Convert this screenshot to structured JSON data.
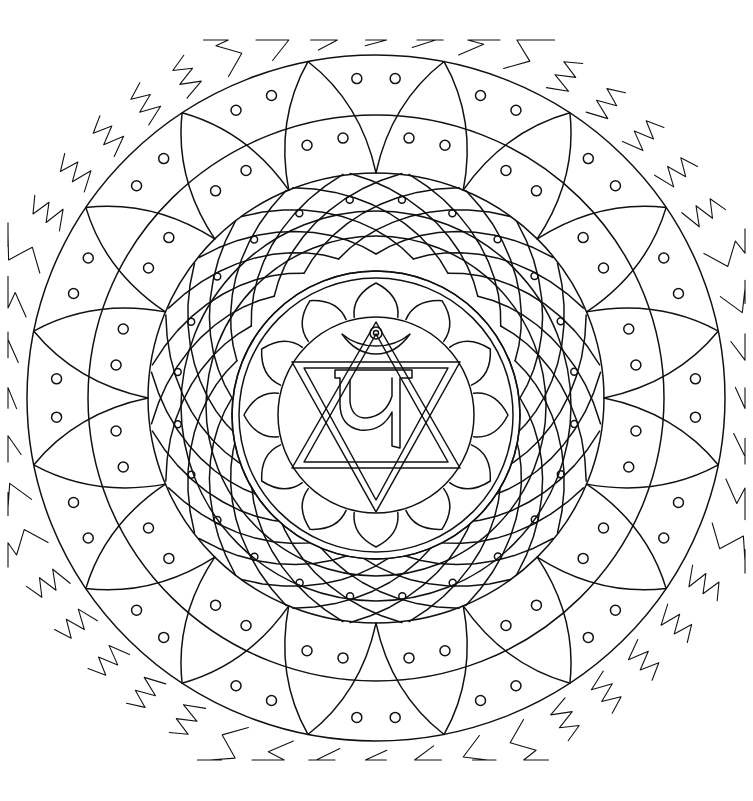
{
  "artwork": {
    "kind": "mandala coloring page",
    "style": "black line art on white",
    "center_symbol_glyph": "यं",
    "center_symbol_name": "yam (heart chakra bija)",
    "colors": {
      "ink": "#111111",
      "background": "#ffffff"
    },
    "layers": [
      {
        "name": "wavy-flame-border",
        "count": 48
      },
      {
        "name": "outer-petal-ring",
        "petals": 16,
        "dots_per_cell": 2
      },
      {
        "name": "lattice-disc",
        "spokes": 24,
        "dots": true
      },
      {
        "name": "inner-lotus",
        "petals": 12
      },
      {
        "name": "hexagram-star"
      },
      {
        "name": "crescent-and-bindu"
      }
    ]
  }
}
